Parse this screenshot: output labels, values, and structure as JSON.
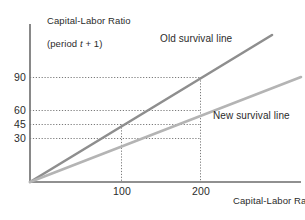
{
  "chart_data": {
    "type": "line",
    "title": "",
    "subtitle": "",
    "ylabel_line1": "Capital-Labor Ratio",
    "ylabel_line2": "(period t + 1)",
    "xlabel_line1": "Capital-Labor Ratio",
    "xlabel_line2": "(period t)",
    "xlabel_italic_var": "t",
    "ylabel_italic_var": "t",
    "xticks": [
      100,
      200
    ],
    "xtick_labels": [
      "100",
      "200"
    ],
    "yticks": [
      30,
      45,
      60,
      90
    ],
    "ytick_labels": [
      "30",
      "45",
      "60",
      "90"
    ],
    "xlim": [
      0,
      265
    ],
    "ylim": [
      0,
      120
    ],
    "grid": "dotted-guides-to-data-points",
    "legend": "inline-annotations",
    "series": [
      {
        "name": "Old survival line",
        "slope": 0.45,
        "intercept": 0,
        "x": [
          0,
          100,
          200,
          265
        ],
        "values": [
          0,
          45,
          90,
          119
        ],
        "color": "#8e8e8e",
        "label": "Old survival line"
      },
      {
        "name": "New survival line",
        "slope": 0.3,
        "intercept": 0,
        "x": [
          0,
          100,
          200,
          265
        ],
        "values": [
          0,
          30,
          60,
          79
        ],
        "color": "#b4b4b4",
        "label": "New survival line"
      }
    ],
    "guides": [
      {
        "x": 100,
        "y": 45,
        "series": "Old survival line"
      },
      {
        "x": 100,
        "y": 30,
        "series": "New survival line"
      },
      {
        "x": 200,
        "y": 90,
        "series": "Old survival line"
      },
      {
        "x": 200,
        "y": 60,
        "series": "New survival line"
      }
    ],
    "annotations": [
      {
        "text": "Old survival line",
        "near": "old-line-upper"
      },
      {
        "text": "New survival line",
        "near": "new-line-upper"
      }
    ],
    "colors": {
      "axis": "#6b6b6b",
      "grid": "#777777",
      "old_line": "#8e8e8e",
      "new_line": "#b4b4b4",
      "text": "#2b2b2b",
      "background": "#ffffff"
    }
  }
}
